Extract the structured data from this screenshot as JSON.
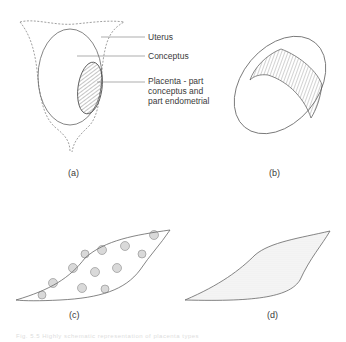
{
  "figure": {
    "panels": [
      {
        "id": "a",
        "label": "(a)"
      },
      {
        "id": "b",
        "label": "(b)"
      },
      {
        "id": "c",
        "label": "(c)"
      },
      {
        "id": "d",
        "label": "(d)"
      }
    ],
    "annotations": {
      "uterus": "Uterus",
      "conceptus": "Conceptus",
      "placenta_line1": "Placenta - part",
      "placenta_line2": "conceptus and",
      "placenta_line3": "part endometrial"
    },
    "caption": "Fig. 5.5  Highly schematic representation of placenta types"
  }
}
